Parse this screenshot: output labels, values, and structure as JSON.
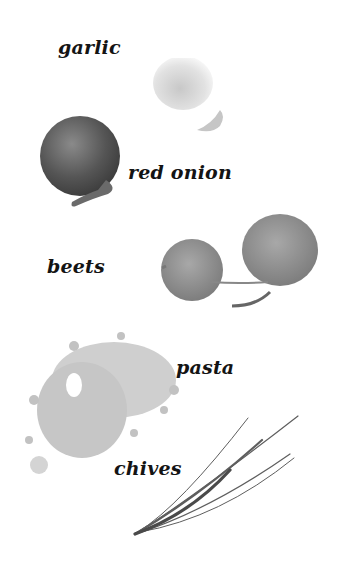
{
  "labels": {
    "garlic": "garlic",
    "red_onion": "red onion",
    "beets": "beets",
    "pasta": "pasta",
    "chives": "chives"
  },
  "colors": {
    "background": "#ffffff",
    "text": "#141414",
    "onion": "#5a5a5a",
    "garlic": "#d8d8d8",
    "beet": "#8a8a8a",
    "pasta": "#c4c4c4",
    "chives": "#6a6a6a"
  }
}
